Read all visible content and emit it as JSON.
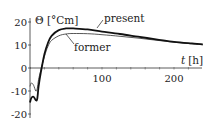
{
  "chart_data": {
    "type": "line",
    "title": "",
    "xlabel": "t [h]",
    "ylabel": "Θ [°Cm]",
    "xlim": [
      0,
      240
    ],
    "ylim": [
      -20,
      20
    ],
    "x_ticks": [
      100,
      200
    ],
    "x_tick_labels": [
      "100",
      "200"
    ],
    "y_ticks": [
      -20,
      -10,
      0,
      10,
      20
    ],
    "y_tick_labels": [
      "-20",
      "-10",
      "0",
      "10",
      "20"
    ],
    "grid": false,
    "legend": "inline annotations",
    "series": [
      {
        "name": "present",
        "style": "thick",
        "x": [
          0,
          2,
          5,
          8,
          10,
          12,
          15,
          20,
          25,
          30,
          40,
          50,
          60,
          80,
          100,
          125,
          150,
          175,
          200,
          225,
          240
        ],
        "values": [
          -15,
          -13,
          -12.5,
          -14,
          -13.5,
          -8,
          -2,
          6,
          11,
          14,
          16.5,
          17.2,
          17.2,
          16.8,
          15.8,
          14.8,
          13.6,
          12.5,
          11.4,
          10.7,
          10.3
        ]
      },
      {
        "name": "former",
        "style": "thin",
        "x": [
          0,
          2,
          5,
          8,
          10,
          12,
          15,
          20,
          25,
          30,
          40,
          50,
          60,
          80,
          100,
          125,
          150,
          175,
          200,
          225,
          240
        ],
        "values": [
          -8,
          -6.5,
          -7.5,
          -10,
          -9,
          -5,
          -1,
          5,
          9.5,
          12,
          14,
          14.8,
          15,
          14.9,
          14.5,
          13.8,
          13,
          12.1,
          11.2,
          10.5,
          10.1
        ]
      }
    ],
    "annotations": [
      {
        "text": "present",
        "points_to": "present"
      },
      {
        "text": "former",
        "points_to": "former"
      }
    ]
  },
  "labels": {
    "ylabel": "Θ [°Cm]",
    "xlabel_t": "t",
    "xlabel_unit": "[h]",
    "present": "present",
    "former": "former",
    "yt_20": "20",
    "yt_10": "10",
    "yt_0": "0",
    "yt_m10": "-10",
    "yt_m20": "-20",
    "xt_100": "100",
    "xt_200": "200"
  }
}
